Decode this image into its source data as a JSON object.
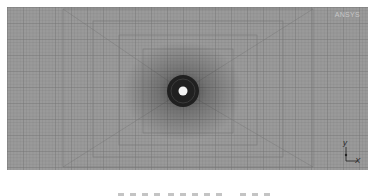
{
  "figure": {
    "logo_text": "ANSYS",
    "axes": {
      "x_label": "X",
      "y_label": "y"
    },
    "mesh": {
      "description": "structured quadrilateral mesh refined around a central circular hole",
      "hole_center": [
        183,
        91
      ],
      "background_color": "#9a9a9a",
      "line_color": "#6e6e6e",
      "hole_color": "#f2f2f2",
      "dense_ring_color": "#1e1e1e"
    }
  }
}
